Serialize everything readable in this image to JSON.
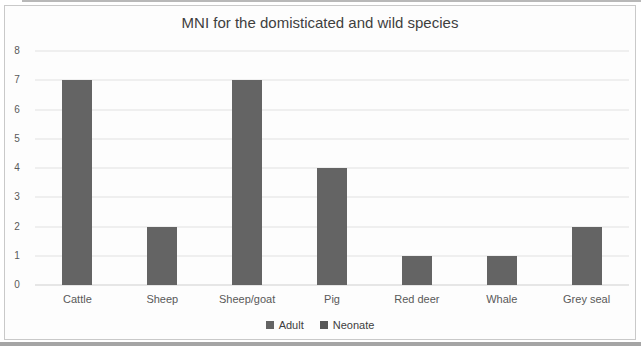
{
  "page": {
    "background": "#ffffff",
    "scan_band_color": "#8f8f8f",
    "frame_border_color": "#c9c9c9"
  },
  "chart_data": {
    "type": "bar",
    "title": "MNI for the domisticated and wild species",
    "categories": [
      "Cattle",
      "Sheep",
      "Sheep/goat",
      "Pig",
      "Red deer",
      "Whale",
      "Grey seal"
    ],
    "series": [
      {
        "name": "Adult",
        "values": [
          7,
          2,
          7,
          4,
          1,
          1,
          2
        ]
      },
      {
        "name": "Neonate",
        "values": [
          0,
          0,
          0,
          0,
          0,
          0,
          0
        ]
      }
    ],
    "xlabel": "",
    "ylabel": "",
    "ylim": [
      0,
      8
    ],
    "ytick_step": 1,
    "yticks": [
      "0",
      "1",
      "2",
      "3",
      "4",
      "5",
      "6",
      "7",
      "8"
    ],
    "grid": true,
    "legend_position": "bottom",
    "series_colors": [
      "#646464",
      "#585858"
    ],
    "gridline_color": "#e2e2e2",
    "axis_text_color": "#595959",
    "title_color": "#3f3f3f"
  }
}
